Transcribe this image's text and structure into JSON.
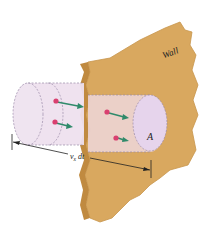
{
  "diagram": {
    "labels": {
      "wall": "Wall",
      "area": "A",
      "length_var": "v",
      "length_sub": "x",
      "length_dt": " dt"
    },
    "elements": {
      "wall_color": "#d9a85f",
      "wall_edge_color": "#c08a40",
      "cylinder_color": "#eee0ee",
      "cylinder_inner_color": "#ecd4d4",
      "end_cap_color": "#e6d4ec",
      "charge_color": "#d94070",
      "arrow_color": "#2e8a6a",
      "dash_color": "#9a8aa8"
    },
    "charges": [
      {
        "id": 1,
        "position": "outside-upper"
      },
      {
        "id": 2,
        "position": "outside-lower"
      },
      {
        "id": 3,
        "position": "inside-upper"
      },
      {
        "id": 4,
        "position": "inside-lower"
      }
    ]
  }
}
